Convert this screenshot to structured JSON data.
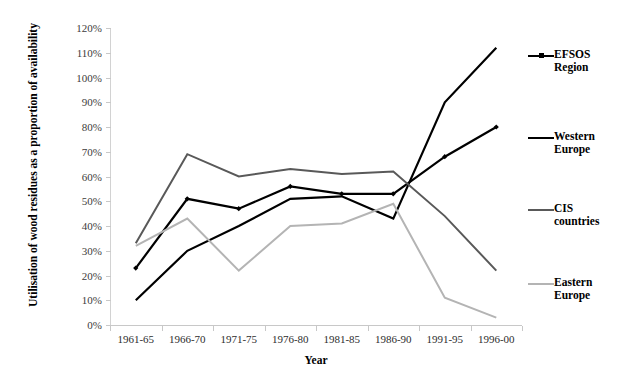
{
  "chart_data": {
    "type": "line",
    "title": "",
    "xlabel": "Year",
    "ylabel": "Utilisation of wood residues as a proportion of availability",
    "categories": [
      "1961-65",
      "1966-70",
      "1971-75",
      "1976-80",
      "1981-85",
      "1986-90",
      "1991-95",
      "1996-00"
    ],
    "ylim": [
      0,
      120
    ],
    "yticks": [
      0,
      10,
      20,
      30,
      40,
      50,
      60,
      70,
      80,
      90,
      100,
      110,
      120
    ],
    "ytick_labels": [
      "0%",
      "10%",
      "20%",
      "30%",
      "40%",
      "50%",
      "60%",
      "70%",
      "80%",
      "90%",
      "100%",
      "110%",
      "120%"
    ],
    "grid": false,
    "legend_position": "right",
    "series": [
      {
        "name": "EFSOS Region",
        "label": "EFSOS\nRegion",
        "color": "#000000",
        "width": 2.2,
        "marker": "diamond",
        "values": [
          23,
          51,
          47,
          56,
          53,
          53,
          68,
          80
        ]
      },
      {
        "name": "Western Europe",
        "label": "Western\nEurope",
        "color": "#000000",
        "width": 2.2,
        "marker": "none",
        "values": [
          10,
          30,
          40,
          51,
          52,
          43,
          90,
          112
        ]
      },
      {
        "name": "CIS countries",
        "label": "CIS\ncountries",
        "color": "#595959",
        "width": 2.0,
        "marker": "none",
        "values": [
          33,
          69,
          60,
          63,
          61,
          62,
          44,
          22
        ]
      },
      {
        "name": "Eastern Europe",
        "label": "Eastern\nEurope",
        "color": "#b4b4b4",
        "width": 2.0,
        "marker": "none",
        "values": [
          32,
          43,
          22,
          40,
          41,
          49,
          11,
          3
        ]
      }
    ]
  },
  "colors": {
    "axis": "#c8c8c8",
    "text": "#000000",
    "tick_text": "#3c3c3c",
    "background": "#ffffff"
  }
}
